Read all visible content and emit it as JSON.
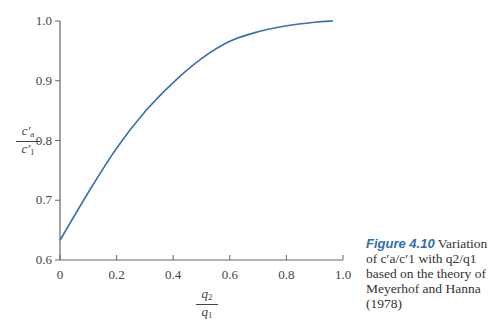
{
  "chart_data": {
    "type": "line",
    "title": "",
    "xlabel": "q2/q1",
    "ylabel": "c'a/c'1",
    "xlim": [
      0,
      1.0
    ],
    "ylim": [
      0.6,
      1.0
    ],
    "x_ticks": [
      "0",
      "0.2",
      "0.4",
      "0.6",
      "0.8",
      "1.0"
    ],
    "y_ticks": [
      "0.6",
      "0.7",
      "0.8",
      "0.9",
      "1.0"
    ],
    "grid": false,
    "series": [
      {
        "name": "c'a/c'1",
        "color": "#3a6fb0",
        "x": [
          0,
          0.1,
          0.2,
          0.3,
          0.4,
          0.5,
          0.6,
          0.7,
          0.8,
          0.9,
          0.965
        ],
        "y": [
          0.633,
          0.713,
          0.787,
          0.848,
          0.897,
          0.937,
          0.966,
          0.982,
          0.992,
          0.998,
          1.0
        ]
      }
    ]
  },
  "axes": {
    "y_label_num": "c′",
    "y_label_num_sub": "a",
    "y_label_den": "c′",
    "y_label_den_sub": "1",
    "x_label_num": "q",
    "x_label_num_sub": "2",
    "x_label_den": "q",
    "x_label_den_sub": "1"
  },
  "caption": {
    "label": "Figure 4.10",
    "text": " Variation of c′a/c′1 with q2/q1 based on the theory of Meyerhof and Hanna (1978)"
  }
}
